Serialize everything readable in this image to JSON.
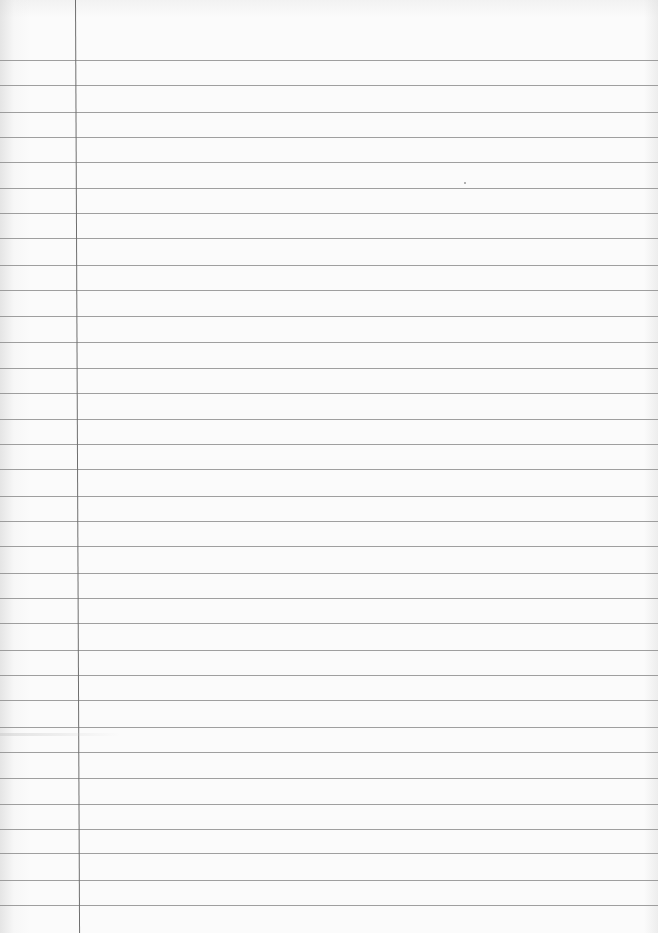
{
  "document": {
    "type": "ruled-notebook-paper",
    "text_content": "",
    "colors": {
      "paper": "#fbfbfb",
      "rule_line": "#8e8e8e",
      "margin_line": "#6f6f6f"
    },
    "margin_line_x": 75,
    "rule_lines_y": [
      60,
      85,
      112,
      137,
      162,
      188,
      213,
      238,
      265,
      290,
      316,
      342,
      368,
      393,
      419,
      444,
      469,
      496,
      521,
      546,
      573,
      598,
      623,
      650,
      675,
      700,
      727,
      752,
      778,
      804,
      829,
      853,
      880,
      905
    ],
    "rule_line_count": 34,
    "specks": [
      {
        "x": 464,
        "y": 182
      }
    ]
  }
}
